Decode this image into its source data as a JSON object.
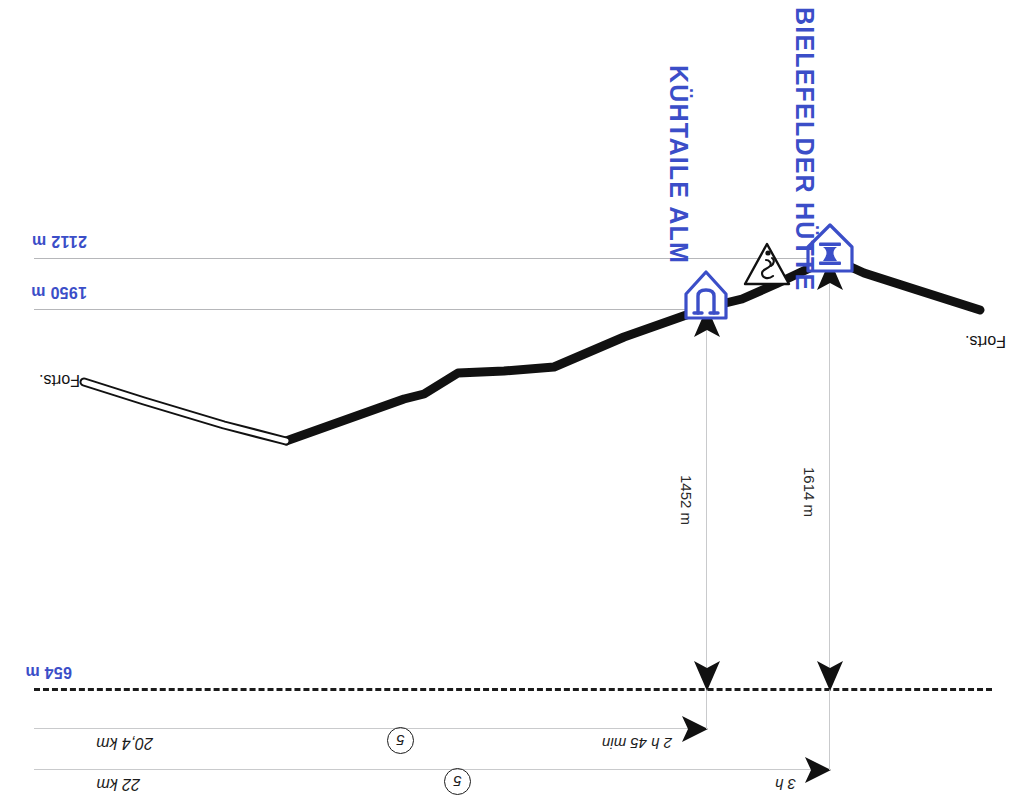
{
  "doc": {
    "kind": "hiking-elevation-profile",
    "orientation_note": "page printed upside down (180 degrees)"
  },
  "top_rows": [
    {
      "distance": "22 km",
      "time": "3 h",
      "stage_number": "5"
    },
    {
      "distance": "20,4 km",
      "time": "2 h 45 min",
      "stage_number": "5"
    }
  ],
  "datum_line": {
    "elevation": "654 m"
  },
  "elevation_gridlines": [
    {
      "elevation": "1950 m"
    },
    {
      "elevation": "2112 m"
    }
  ],
  "drop_labels": [
    {
      "value": "1614 m"
    },
    {
      "value": "1452 m"
    }
  ],
  "waypoints": [
    {
      "name": "BIELEFELDER HÜTTE",
      "marker": "hut-marker",
      "elevation_ref": "2112 m",
      "drop": "1614 m",
      "distance": "22 km",
      "time": "3 h"
    },
    {
      "name": "KÜHTAILE ALM",
      "marker": "alm-marker",
      "elevation_ref": "1950 m",
      "drop": "1452 m",
      "distance": "20,4 km",
      "time": "2 h 45 min"
    }
  ],
  "continuation_labels": {
    "left": "Forts.",
    "right": "Forts."
  },
  "warning_sign": {
    "name": "scramble-warning-sign",
    "shape": "inverted-triangle"
  },
  "colors": {
    "accent_blue": "#3b4ec8",
    "profile_black": "#111111",
    "grid_grey": "#c9cacc"
  },
  "chart_data": {
    "type": "line",
    "title": "",
    "xlabel": "",
    "ylabel": "Elevation",
    "grid": true,
    "legend": "none",
    "note": "Schematic hiking elevation profile; x is route progress (left = later / higher km), y is elevation. Rendered rotated 180 degrees.",
    "annotations": [
      {
        "label": "654 m",
        "type": "datum-dashed-line"
      },
      {
        "label": "1950 m",
        "type": "gridline"
      },
      {
        "label": "2112 m",
        "type": "gridline"
      },
      {
        "label": "1614 m",
        "type": "vertical-drop"
      },
      {
        "label": "1452 m",
        "type": "vertical-drop"
      }
    ],
    "points": [
      {
        "x": 44,
        "y": 497
      },
      {
        "x": 110,
        "y": 518
      },
      {
        "x": 160,
        "y": 534
      },
      {
        "x": 193,
        "y": 549
      },
      {
        "x": 248,
        "y": 523
      },
      {
        "x": 282,
        "y": 508
      },
      {
        "x": 315,
        "y": 500
      },
      {
        "x": 400,
        "y": 470
      },
      {
        "x": 470,
        "y": 440
      },
      {
        "x": 520,
        "y": 436
      },
      {
        "x": 566,
        "y": 434
      },
      {
        "x": 600,
        "y": 413
      },
      {
        "x": 620,
        "y": 408
      },
      {
        "x": 738,
        "y": 366
      },
      {
        "x": 800,
        "y": 382
      },
      {
        "x": 880,
        "y": 406
      },
      {
        "x": 940,
        "y": 425
      }
    ],
    "hollow_segment_from_index": 13
  }
}
